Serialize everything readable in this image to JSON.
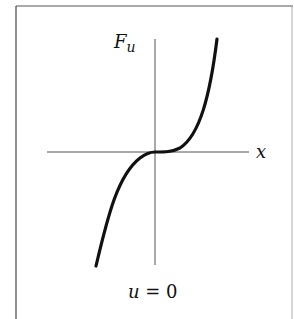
{
  "figure": {
    "y_axis_label": "F",
    "y_axis_sub": "u",
    "x_axis_label": "x",
    "caption_var": "u",
    "caption_rest": " = 0",
    "curve": "cubic-like: F_u = x^3 (inflection at origin, flat tangent)"
  },
  "colors": {
    "ink": "#111111",
    "axis": "#555555",
    "frame": "#444444",
    "background": "#ffffff"
  }
}
